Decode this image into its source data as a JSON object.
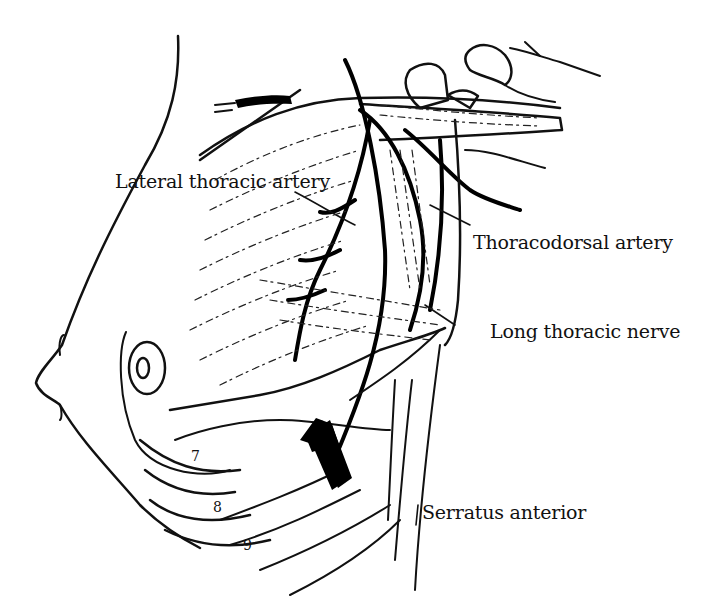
{
  "figure": {
    "type": "anatomical line drawing",
    "colors": {
      "ink": "#111111",
      "background": "#ffffff"
    }
  },
  "labels": [
    {
      "id": "lateral-thoracic-artery",
      "text": "Lateral thoracic artery"
    },
    {
      "id": "thoracodorsal-artery",
      "text": "Thoracodorsal artery"
    },
    {
      "id": "long-thoracic-nerve",
      "text": "Long thoracic nerve"
    },
    {
      "id": "serratus-anterior",
      "text": "Serratus anterior"
    }
  ],
  "rib_numbers": [
    "7",
    "8",
    "9"
  ],
  "annotations": {
    "arrow": "large black arrow pointing up-left toward axilla"
  }
}
